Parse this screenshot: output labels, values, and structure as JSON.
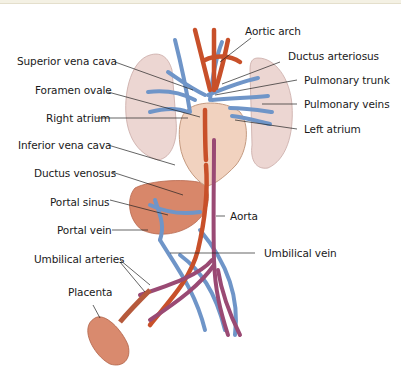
{
  "figure": {
    "labels_left": [
      {
        "id": "superior-vena-cava",
        "text": "Superior vena cava"
      },
      {
        "id": "foramen-ovale",
        "text": "Foramen ovale"
      },
      {
        "id": "right-atrium",
        "text": "Right atrium"
      },
      {
        "id": "inferior-vena-cava",
        "text": "Inferior vena cava"
      },
      {
        "id": "ductus-venosus",
        "text": "Ductus venosus"
      },
      {
        "id": "portal-sinus",
        "text": "Portal sinus"
      },
      {
        "id": "portal-vein",
        "text": "Portal vein"
      },
      {
        "id": "umbilical-arteries",
        "text": "Umbilical arteries"
      },
      {
        "id": "placenta",
        "text": "Placenta"
      }
    ],
    "labels_right": [
      {
        "id": "aortic-arch",
        "text": "Aortic arch"
      },
      {
        "id": "ductus-arteriosus",
        "text": "Ductus arteriosus"
      },
      {
        "id": "pulmonary-trunk",
        "text": "Pulmonary trunk"
      },
      {
        "id": "pulmonary-veins",
        "text": "Pulmonary veins"
      },
      {
        "id": "left-atrium",
        "text": "Left atrium"
      },
      {
        "id": "aorta",
        "text": "Aorta"
      },
      {
        "id": "umbilical-vein",
        "text": "Umbilical vein"
      }
    ],
    "colors": {
      "oxygenated": "#c8502a",
      "deoxygenated": "#6f95c8",
      "mixed": "#9a4a74",
      "lung": "#ecd6d2",
      "heart": "#f1d2bf",
      "liver": "#d8876a",
      "placenta": "#d98a6e",
      "header_band": "#f4f1e4"
    }
  }
}
